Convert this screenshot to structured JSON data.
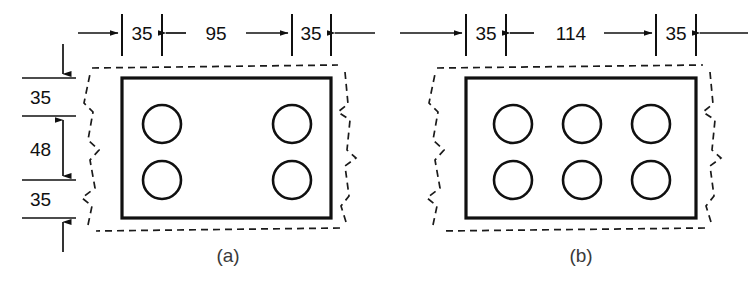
{
  "figure": {
    "units_note": "",
    "stroke_color": "#101010",
    "background_color": "#ffffff",
    "break_line_color": "#1a1a1a"
  },
  "panels": [
    {
      "id": "a",
      "caption": "(a)",
      "hole_rows": 2,
      "hole_cols": 2,
      "horizontal_dimensions": [
        "35",
        "95",
        "35"
      ],
      "vertical_dimensions": [
        "35",
        "48",
        "35"
      ]
    },
    {
      "id": "b",
      "caption": "(b)",
      "hole_rows": 2,
      "hole_cols": 3,
      "horizontal_dimensions": [
        "35",
        "114",
        "35"
      ],
      "vertical_dimensions": []
    }
  ],
  "labels": {
    "a_h1": "35",
    "a_h2": "95",
    "a_h3": "35",
    "a_v1": "35",
    "a_v2": "48",
    "a_v3": "35",
    "b_h1": "35",
    "b_h2": "114",
    "b_h3": "35",
    "caption_a": "(a)",
    "caption_b": "(b)"
  }
}
